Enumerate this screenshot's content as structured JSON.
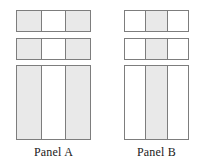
{
  "figure": {
    "type": "two-panel-diagram",
    "background_color": "#ffffff",
    "shaded_cell_color": "#e9e9e9",
    "unshaded_cell_color": "#ffffff",
    "border_color": "#7d7d7d"
  },
  "panels": [
    {
      "id": "panel-a",
      "label": "Panel A",
      "shading_pattern": "shaded-unshaded-shaded",
      "blocks": [
        {
          "name": "row-1",
          "cells": [
            {
              "label": "",
              "shaded": true
            },
            {
              "label": "",
              "shaded": false
            },
            {
              "label": "",
              "shaded": true
            }
          ]
        },
        {
          "name": "row-2",
          "cells": [
            {
              "label": "",
              "shaded": true
            },
            {
              "label": "",
              "shaded": false
            },
            {
              "label": "",
              "shaded": true
            }
          ]
        },
        {
          "name": "row-3",
          "cells": [
            {
              "label": "",
              "shaded": true
            },
            {
              "label": "",
              "shaded": false
            },
            {
              "label": "",
              "shaded": true
            }
          ]
        }
      ]
    },
    {
      "id": "panel-b",
      "label": "Panel B",
      "shading_pattern": "unshaded-shaded-unshaded",
      "blocks": [
        {
          "name": "row-1",
          "cells": [
            {
              "label": "",
              "shaded": false
            },
            {
              "label": "",
              "shaded": true
            },
            {
              "label": "",
              "shaded": false
            }
          ]
        },
        {
          "name": "row-2",
          "cells": [
            {
              "label": "",
              "shaded": false
            },
            {
              "label": "",
              "shaded": true
            },
            {
              "label": "",
              "shaded": false
            }
          ]
        },
        {
          "name": "row-3",
          "cells": [
            {
              "label": "",
              "shaded": false
            },
            {
              "label": "",
              "shaded": true
            },
            {
              "label": "",
              "shaded": false
            }
          ]
        }
      ]
    }
  ]
}
